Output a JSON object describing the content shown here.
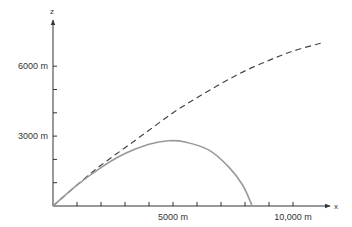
{
  "chart_data": {
    "type": "line",
    "title": "",
    "xlabel": "x",
    "ylabel": "z",
    "xlim": [
      0,
      11600
    ],
    "ylim": [
      0,
      7800
    ],
    "grid": false,
    "legend": null,
    "x_ticks": [
      1000,
      2000,
      3000,
      4000,
      5000,
      6000,
      7000,
      8000,
      9000,
      10000
    ],
    "y_ticks": [
      1000,
      2000,
      3000,
      4000,
      5000,
      6000
    ],
    "x_tick_labels": [
      {
        "value": 5000,
        "label": "5000 m"
      },
      {
        "value": 10000,
        "label": "10,000 m"
      }
    ],
    "y_tick_labels": [
      {
        "value": 3000,
        "label": "3000 m"
      },
      {
        "value": 6000,
        "label": "6000 m"
      }
    ],
    "series": [
      {
        "name": "trajectory-without-air-resistance",
        "style": "dashed",
        "color": "#444444",
        "points": [
          [
            0,
            0
          ],
          [
            1000,
            900
          ],
          [
            2000,
            1750
          ],
          [
            3000,
            2500
          ],
          [
            4000,
            3250
          ],
          [
            5000,
            4000
          ],
          [
            6000,
            4650
          ],
          [
            7000,
            5250
          ],
          [
            8000,
            5800
          ],
          [
            9000,
            6250
          ],
          [
            10000,
            6650
          ],
          [
            11200,
            7000
          ]
        ]
      },
      {
        "name": "trajectory-with-air-resistance",
        "style": "solid",
        "color": "#9a9a9a",
        "points": [
          [
            0,
            0
          ],
          [
            1000,
            900
          ],
          [
            2000,
            1650
          ],
          [
            3000,
            2250
          ],
          [
            4000,
            2650
          ],
          [
            4800,
            2800
          ],
          [
            5500,
            2750
          ],
          [
            6500,
            2400
          ],
          [
            7300,
            1700
          ],
          [
            7900,
            900
          ],
          [
            8300,
            0
          ]
        ]
      }
    ]
  }
}
